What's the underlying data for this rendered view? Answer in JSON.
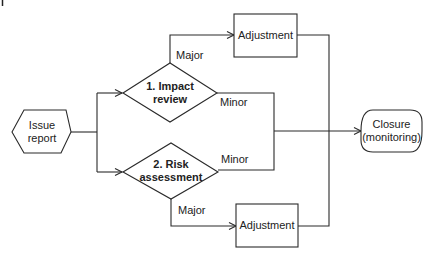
{
  "nodes": {
    "issue_report": {
      "line1": "Issue",
      "line2": "report"
    },
    "impact_review": {
      "line1": "1. Impact",
      "line2": "review"
    },
    "risk_assessment": {
      "line1": "2. Risk",
      "line2": "assessment"
    },
    "adjustment_top": {
      "label": "Adjustment"
    },
    "adjustment_bottom": {
      "label": "Adjustment"
    },
    "closure": {
      "line1": "Closure",
      "line2": "(monitoring)"
    }
  },
  "edges": {
    "impact_major": "Major",
    "impact_minor": "Minor",
    "risk_minor": "Minor",
    "risk_major": "Major"
  },
  "colors": {
    "stroke": "#2a2a2a",
    "text": "#222222",
    "background": "#ffffff"
  }
}
